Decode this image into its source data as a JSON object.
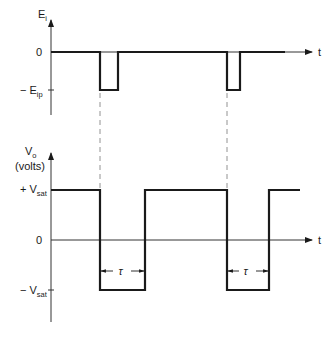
{
  "top_plot": {
    "y_axis_label": "E",
    "y_axis_sub": "i",
    "x_axis_label": "t",
    "zero_label": "0",
    "neg_level_label": "− E",
    "neg_level_sub": "ip",
    "pulses": [
      {
        "start_x": 100,
        "end_x": 118
      },
      {
        "start_x": 227,
        "end_x": 240
      }
    ]
  },
  "bottom_plot": {
    "y_axis_label": "V",
    "y_axis_sub": "o",
    "y_axis_unit": "(volts)",
    "x_axis_label": "t",
    "pos_level_label": "+ V",
    "pos_level_sub": "sat",
    "zero_label": "0",
    "neg_level_label": "− V",
    "neg_level_sub": "sat",
    "tau_label": "τ",
    "low_intervals": [
      {
        "start_x": 100,
        "end_x": 145
      },
      {
        "start_x": 227,
        "end_x": 269
      }
    ]
  },
  "colors": {
    "line": "#1a1a1a",
    "axis": "#333333",
    "dashed": "#777777"
  }
}
